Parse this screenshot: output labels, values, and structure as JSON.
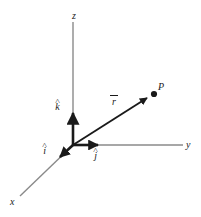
{
  "figure": {
    "background_color": "#ffffff",
    "ink_color": "#1a1a1a",
    "axis_color": "#808080",
    "width": 201,
    "height": 217
  },
  "axes": [
    {
      "name": "z-axis",
      "label": "z",
      "label_x": 72,
      "label_y": 11,
      "from": [
        73,
        145
      ],
      "to": [
        73,
        22
      ]
    },
    {
      "name": "y-axis",
      "label": "y",
      "label_x": 186,
      "label_y": 140,
      "from": [
        73,
        145
      ],
      "to": [
        183,
        145
      ]
    },
    {
      "name": "x-axis",
      "label": "x",
      "label_x": 10,
      "label_y": 197,
      "from": [
        73,
        145
      ],
      "to": [
        20,
        196
      ]
    }
  ],
  "unit_vectors": [
    {
      "name": "k-hat",
      "hat": "˄",
      "letter": "k",
      "label_x": 55,
      "label_y": 97,
      "arrow_from": [
        73,
        145
      ],
      "arrow_to": [
        73,
        112
      ]
    },
    {
      "name": "j-hat",
      "hat": "˄",
      "letter": "j",
      "label_x": 93,
      "label_y": 146,
      "arrow_from": [
        73,
        145
      ],
      "arrow_to": [
        99,
        145
      ]
    },
    {
      "name": "i-hat",
      "hat": "˄",
      "letter": "i",
      "label_x": 42,
      "label_y": 141,
      "arrow_from": [
        73,
        145
      ],
      "arrow_to": [
        59,
        158
      ]
    }
  ],
  "position_vector": {
    "name": "r-vector",
    "letter": "r",
    "label_x": 110,
    "label_y": 95,
    "from": [
      73,
      145
    ],
    "to": [
      148,
      97
    ]
  },
  "point": {
    "name": "point-P",
    "label": "P",
    "label_x": 158,
    "label_y": 82,
    "x": 154,
    "y": 94,
    "radius": 3
  }
}
